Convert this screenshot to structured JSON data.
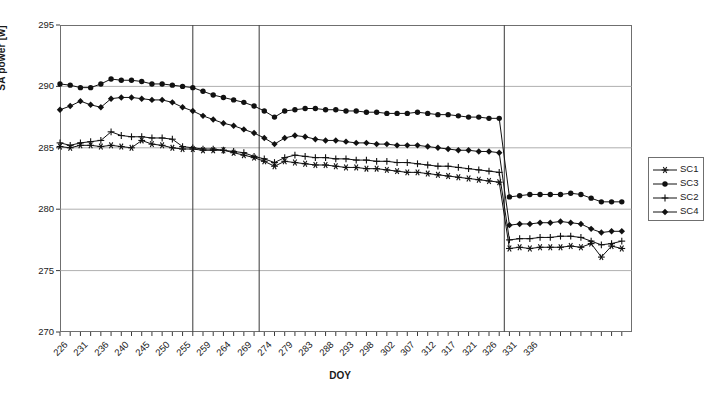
{
  "chart_data": {
    "type": "line",
    "title": "",
    "xlabel": "DOY",
    "ylabel": "SA power [w]",
    "ylim": [
      270,
      295
    ],
    "yticks": [
      270,
      275,
      280,
      285,
      290,
      295
    ],
    "xlim": [
      226,
      338
    ],
    "grid": "horizontal-and-vertical",
    "vertical_gridlines": [
      252,
      265,
      313
    ],
    "legend_position": "right",
    "tick_labels": [
      "226",
      "231",
      "236",
      "240",
      "245",
      "250",
      "255",
      "259",
      "264",
      "269",
      "274",
      "279",
      "283",
      "288",
      "293",
      "298",
      "302",
      "307",
      "312",
      "317",
      "321",
      "326",
      "331",
      "336"
    ],
    "x": [
      226,
      228,
      230,
      232,
      234,
      236,
      238,
      240,
      242,
      244,
      246,
      248,
      250,
      252,
      254,
      256,
      258,
      260,
      262,
      264,
      266,
      268,
      270,
      272,
      274,
      276,
      278,
      280,
      282,
      284,
      286,
      288,
      290,
      292,
      294,
      296,
      298,
      300,
      302,
      304,
      306,
      308,
      310,
      312,
      314,
      316,
      318,
      320,
      322,
      324,
      326,
      328,
      330,
      332,
      334,
      336
    ],
    "series": [
      {
        "name": "SC1",
        "marker": "asterisk",
        "values": [
          285.1,
          285.0,
          285.2,
          285.2,
          285.1,
          285.2,
          285.1,
          285.0,
          285.6,
          285.3,
          285.2,
          285.0,
          284.9,
          284.9,
          284.8,
          284.8,
          284.8,
          284.6,
          284.4,
          284.2,
          283.9,
          283.5,
          283.9,
          283.8,
          283.7,
          283.6,
          283.6,
          283.5,
          283.4,
          283.4,
          283.3,
          283.3,
          283.2,
          283.1,
          283.0,
          283.0,
          282.9,
          282.8,
          282.7,
          282.6,
          282.5,
          282.4,
          282.3,
          282.2,
          276.8,
          276.9,
          276.8,
          276.9,
          276.9,
          276.9,
          277.0,
          276.9,
          277.2,
          276.1,
          277.0,
          276.8
        ]
      },
      {
        "name": "SC3",
        "marker": "circle",
        "values": [
          290.2,
          290.1,
          289.9,
          289.9,
          290.2,
          290.6,
          290.5,
          290.5,
          290.4,
          290.2,
          290.2,
          290.1,
          290.0,
          289.9,
          289.6,
          289.3,
          289.1,
          288.9,
          288.7,
          288.4,
          288.0,
          287.5,
          288.0,
          288.1,
          288.2,
          288.2,
          288.1,
          288.1,
          288.0,
          288.0,
          287.9,
          287.9,
          287.8,
          287.8,
          287.8,
          287.9,
          287.8,
          287.7,
          287.7,
          287.6,
          287.5,
          287.5,
          287.4,
          287.4,
          281.0,
          281.1,
          281.2,
          281.2,
          281.2,
          281.2,
          281.3,
          281.2,
          280.9,
          280.6,
          280.6,
          280.6
        ]
      },
      {
        "name": "SC2",
        "marker": "plus",
        "values": [
          285.4,
          285.2,
          285.4,
          285.5,
          285.6,
          286.3,
          286.0,
          285.9,
          285.9,
          285.8,
          285.8,
          285.7,
          285.1,
          285.0,
          284.9,
          284.9,
          284.8,
          284.7,
          284.6,
          284.3,
          284.1,
          283.8,
          284.2,
          284.4,
          284.3,
          284.2,
          284.2,
          284.1,
          284.1,
          284.0,
          284.0,
          283.9,
          283.9,
          283.8,
          283.8,
          283.7,
          283.6,
          283.5,
          283.5,
          283.4,
          283.3,
          283.2,
          283.1,
          283.0,
          277.5,
          277.6,
          277.6,
          277.7,
          277.7,
          277.8,
          277.8,
          277.7,
          277.4,
          277.1,
          277.2,
          277.4
        ]
      },
      {
        "name": "SC4",
        "marker": "diamond",
        "values": [
          288.1,
          288.4,
          288.8,
          288.5,
          288.3,
          289.0,
          289.1,
          289.1,
          289.0,
          288.9,
          288.9,
          288.7,
          288.3,
          288.0,
          287.6,
          287.3,
          287.0,
          286.8,
          286.5,
          286.2,
          285.8,
          285.3,
          285.8,
          286.0,
          285.9,
          285.7,
          285.6,
          285.6,
          285.5,
          285.4,
          285.4,
          285.3,
          285.3,
          285.2,
          285.2,
          285.2,
          285.1,
          285.0,
          284.9,
          284.8,
          284.8,
          284.7,
          284.7,
          284.6,
          278.7,
          278.8,
          278.8,
          278.9,
          278.9,
          279.0,
          278.9,
          278.8,
          278.4,
          278.1,
          278.2,
          278.2
        ]
      }
    ]
  },
  "legend": {
    "entries": [
      {
        "label": "SC1"
      },
      {
        "label": "SC3"
      },
      {
        "label": "SC2"
      },
      {
        "label": "SC4"
      }
    ]
  }
}
